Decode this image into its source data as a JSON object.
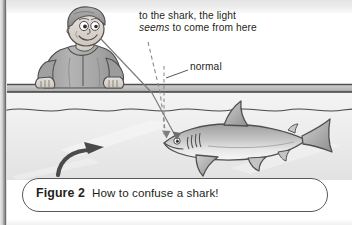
{
  "figure": {
    "caption_label": "Figure 2",
    "caption_body": "How to confuse a shark!"
  },
  "annotations": {
    "ray_callout_line1": "to the shark, the light",
    "ray_callout_line2_italic": "seems",
    "ray_callout_line2_rest": " to come from here",
    "normal_label": "normal"
  },
  "scene": {
    "observer": "man-leaning-on-dock",
    "subject": "shark-underwater",
    "medium_upper": "air",
    "medium_lower": "water",
    "direction_arrow": "curved-arrow-up-right"
  },
  "colors": {
    "ink": "#231f20",
    "outline": "#58585a",
    "skin": "#d9d2cb",
    "hair": "#9a9a9a",
    "jacket": "#a8a8a8",
    "jacket_shadow": "#8c8c8c",
    "dock": "#c4c4c4",
    "water": "#efefef",
    "water_deep": "#e4e4e4",
    "shark_body": "#bdbdbd",
    "shark_belly": "#f2f2f2",
    "ray_solid": "#6d6d6d",
    "ray_dashed": "#8a8a8a",
    "gutter": "#8d8d8d"
  }
}
